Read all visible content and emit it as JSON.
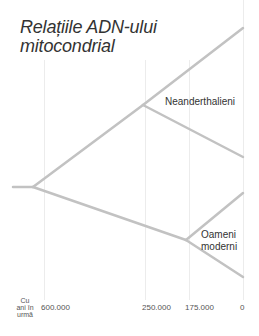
{
  "title": "Relațiile ADN-ului mitocondrial",
  "title_lines": [
    "Relațiile ADN-ului",
    "mitocondrial"
  ],
  "labels": {
    "neanderthal": "Neanderthalieni",
    "modern_line1": "Oameni",
    "modern_line2": "moderni"
  },
  "axis": {
    "unit_lines": [
      "Cu",
      "ani în",
      "urmă"
    ],
    "ticks": [
      "600.000",
      "250.000",
      "175.000",
      "0"
    ]
  },
  "colors": {
    "branch": "#c2c2c2",
    "grid": "#ececec",
    "text": "#333333"
  }
}
